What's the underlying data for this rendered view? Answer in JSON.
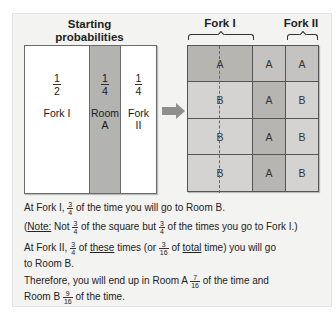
{
  "left_panel": {
    "title_line1": "Starting",
    "title_line2": "probabilities",
    "columns": [
      {
        "fraction": {
          "num": "1",
          "den": "2"
        },
        "label_line1": "Fork I",
        "label_line2": "",
        "shaded": false
      },
      {
        "fraction": {
          "num": "1",
          "den": "4"
        },
        "label_line1": "Room",
        "label_line2": "A",
        "shaded": true
      },
      {
        "fraction": {
          "num": "1",
          "den": "4"
        },
        "label_line1": "Fork",
        "label_line2": "II",
        "shaded": false
      }
    ]
  },
  "arrow": {
    "icon": "right-arrow-icon",
    "color": "#8f8f8f"
  },
  "right_panel": {
    "header_fork1": "Fork I",
    "header_fork2": "Fork II",
    "rows": [
      [
        "A",
        "A",
        "A"
      ],
      [
        "B",
        "A",
        "B"
      ],
      [
        "B",
        "A",
        "B"
      ],
      [
        "B",
        "A",
        "B"
      ]
    ],
    "colors": {
      "dark": "#b6b5b2",
      "mid": "#c4c3c1",
      "light": "#d4d3d1"
    }
  },
  "text": {
    "line1": {
      "pre": "At Fork I, ",
      "frac": {
        "num": "3",
        "den": "4"
      },
      "post": " of the time you will go to Room B."
    },
    "line2": {
      "open": "(",
      "note": "Note:",
      "a": " Not ",
      "frac1": {
        "num": "3",
        "den": "4"
      },
      "b": " of the square but ",
      "frac2": {
        "num": "3",
        "den": "4"
      },
      "c": " of the times you go to Fork I.)"
    },
    "line3": {
      "pre": "At Fork II, ",
      "frac1": {
        "num": "3",
        "den": "4"
      },
      "a": " of ",
      "these": "these",
      "b": " times (or ",
      "frac2": {
        "num": "3",
        "den": "16"
      },
      "c": " of ",
      "total": "total",
      "d": " time) you will go"
    },
    "line4": "to Room B.",
    "line5": {
      "pre": "Therefore, you will end up in Room A ",
      "frac": {
        "num": "7",
        "den": "16"
      },
      "post": " of the time and"
    },
    "line6": {
      "pre": "Room B ",
      "frac": {
        "num": "9",
        "den": "16"
      },
      "post": " of the time."
    }
  }
}
